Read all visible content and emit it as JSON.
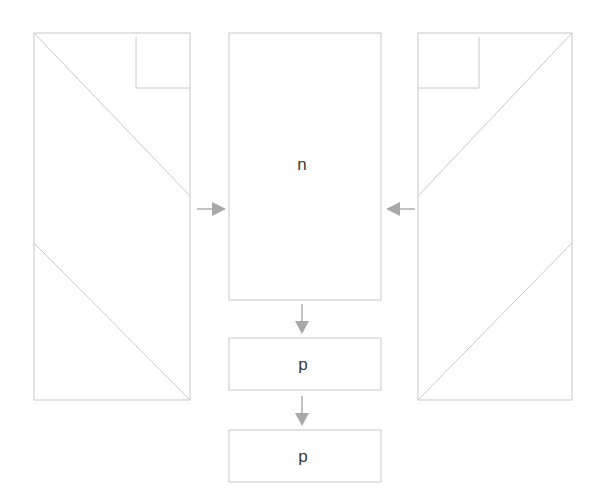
{
  "diagram": {
    "background_color": "#ffffff",
    "stroke_color": "#c8c8c8",
    "arrow_color": "#a8a8a8",
    "text_color": "#3a3a3a",
    "canvas": {
      "width": 599,
      "height": 504
    },
    "nodes": [
      {
        "id": "left-stack",
        "kind": "layered-rect",
        "label": "",
        "x": 34,
        "y": 33,
        "width": 156,
        "height": 367,
        "inner_box": {
          "x": 136,
          "y": 37,
          "width": 54,
          "height": 51,
          "corner": "top-right"
        },
        "diagonals": [
          {
            "x1": 34,
            "y1": 33,
            "x2": 190,
            "y2": 196
          },
          {
            "x1": 34,
            "y1": 243,
            "x2": 190,
            "y2": 400
          }
        ]
      },
      {
        "id": "center-n",
        "kind": "rect",
        "label": "n",
        "x": 229,
        "y": 33,
        "width": 152,
        "height": 267
      },
      {
        "id": "p-first",
        "kind": "rect",
        "label": "p",
        "x": 229,
        "y": 338,
        "width": 152,
        "height": 52
      },
      {
        "id": "p-second",
        "kind": "rect",
        "label": "p",
        "x": 229,
        "y": 430,
        "width": 152,
        "height": 52
      },
      {
        "id": "right-stack",
        "kind": "layered-rect",
        "label": "",
        "x": 418,
        "y": 33,
        "width": 154,
        "height": 367,
        "inner_box": {
          "x": 418,
          "y": 37,
          "width": 61,
          "height": 51,
          "corner": "top-left"
        },
        "diagonals": [
          {
            "x1": 572,
            "y1": 33,
            "x2": 418,
            "y2": 196
          },
          {
            "x1": 572,
            "y1": 243,
            "x2": 418,
            "y2": 400
          }
        ]
      }
    ],
    "arrows": [
      {
        "id": "arrow-left-to-center",
        "from": "left-stack",
        "to": "center-n",
        "direction": "right",
        "x1": 197,
        "y1": 209,
        "x2": 226,
        "y2": 209
      },
      {
        "id": "arrow-right-to-center",
        "from": "right-stack",
        "to": "center-n",
        "direction": "left",
        "x1": 415,
        "y1": 209,
        "x2": 386,
        "y2": 209
      },
      {
        "id": "arrow-center-to-p-first",
        "from": "center-n",
        "to": "p-first",
        "direction": "down",
        "x1": 302,
        "y1": 304,
        "x2": 302,
        "y2": 334
      },
      {
        "id": "arrow-p-first-to-p-second",
        "from": "p-first",
        "to": "p-second",
        "direction": "down",
        "x1": 302,
        "y1": 396,
        "x2": 302,
        "y2": 426
      }
    ],
    "labels": [
      {
        "id": "label-n",
        "text": "n",
        "cx": 302,
        "cy": 164,
        "font_size": 17
      },
      {
        "id": "label-p-first",
        "text": "p",
        "cx": 303,
        "cy": 364,
        "font_size": 17
      },
      {
        "id": "label-p-second",
        "text": "p",
        "cx": 303,
        "cy": 456,
        "font_size": 17
      }
    ]
  }
}
